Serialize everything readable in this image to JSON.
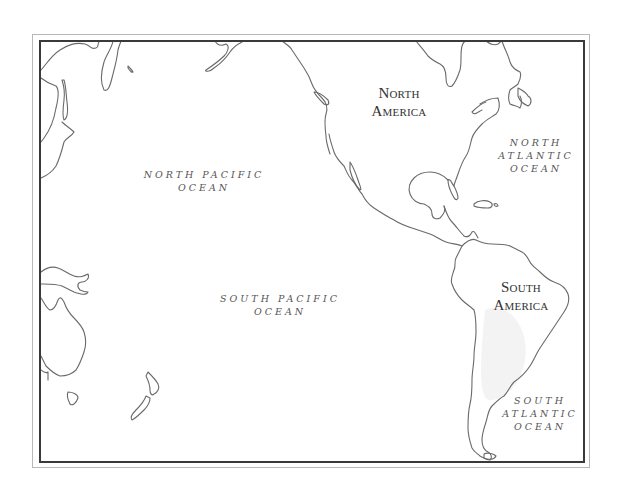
{
  "map": {
    "type": "outline-map",
    "region": "Pacific Ocean and the Americas",
    "colors": {
      "background": "#ffffff",
      "coastline": "#6a6a6a",
      "inner_frame": "#3a3a3a",
      "outer_frame": "#b8b8b8",
      "text": "#4a4a4a",
      "shading": "#f3f3f3"
    },
    "labels": {
      "north_america": {
        "line1": "North",
        "line2": "America"
      },
      "south_america": {
        "line1": "South",
        "line2": "America"
      },
      "north_pacific": {
        "line1": "NORTH PACIFIC",
        "line2": "OCEAN"
      },
      "south_pacific": {
        "line1": "SOUTH PACIFIC",
        "line2": "OCEAN"
      },
      "north_atlantic": {
        "line1": "NORTH",
        "line2": "ATLANTIC",
        "line3": "OCEAN"
      },
      "south_atlantic": {
        "line1": "SOUTH",
        "line2": "ATLANTIC",
        "line3": "OCEAN"
      }
    },
    "landmasses": [
      "North America",
      "South America",
      "Asia",
      "Australia",
      "New Zealand",
      "Greenland",
      "Caribbean islands"
    ]
  }
}
